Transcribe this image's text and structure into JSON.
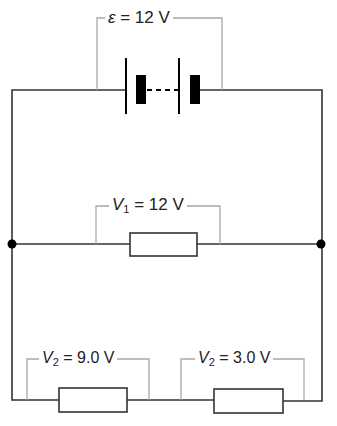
{
  "diagram": {
    "type": "electric-circuit",
    "colors": {
      "wire": "#333333",
      "bracket": "#a0a0a0",
      "text": "#222222",
      "cell": "#000000"
    },
    "battery": {
      "label_symbol": "ε",
      "label_rest": " = 12 V",
      "cells": 2,
      "connection": "dashed"
    },
    "branches": [
      {
        "name": "upper-branch",
        "resistors": [
          {
            "symbol": "V",
            "subscript": "1",
            "value": " = 12 V"
          }
        ]
      },
      {
        "name": "lower-branch",
        "resistors": [
          {
            "symbol": "V",
            "subscript": "2",
            "value": " = 9.0 V"
          },
          {
            "symbol": "V",
            "subscript": "2",
            "value": " = 3.0 V"
          }
        ]
      }
    ],
    "junctions": [
      "left-junction",
      "right-junction"
    ]
  }
}
